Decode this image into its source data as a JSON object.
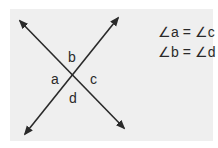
{
  "diagram": {
    "angle_labels": {
      "a": "a",
      "b": "b",
      "c": "c",
      "d": "d"
    },
    "equations": [
      "∠a = ∠c",
      "∠b = ∠d"
    ],
    "colors": {
      "background": "#efefef",
      "line": "#2a2a2a"
    }
  }
}
